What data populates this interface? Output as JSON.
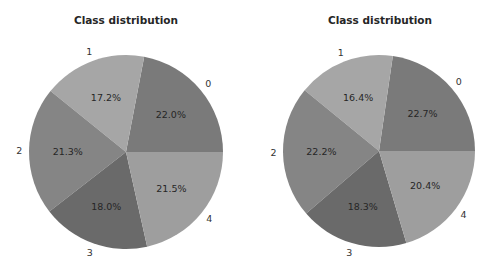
{
  "chart_data": [
    {
      "type": "pie",
      "title": "Class distribution",
      "categories": [
        "0",
        "1",
        "2",
        "3",
        "4"
      ],
      "values": [
        22.0,
        17.2,
        21.3,
        18.0,
        21.5
      ],
      "value_labels": [
        "22.0%",
        "17.2%",
        "21.3%",
        "18.0%",
        "21.5%"
      ],
      "colors": [
        "#7a7a7a",
        "#a6a6a6",
        "#858585",
        "#6a6a6a",
        "#9e9e9e"
      ],
      "start_angle": 0,
      "direction": "counterclockwise",
      "legend": false
    },
    {
      "type": "pie",
      "title": "Class distribution",
      "categories": [
        "0",
        "1",
        "2",
        "3",
        "4"
      ],
      "values": [
        22.7,
        16.4,
        22.2,
        18.3,
        20.4
      ],
      "value_labels": [
        "22.7%",
        "16.4%",
        "22.2%",
        "18.3%",
        "20.4%"
      ],
      "colors": [
        "#7a7a7a",
        "#a6a6a6",
        "#858585",
        "#6a6a6a",
        "#9e9e9e"
      ],
      "start_angle": 0,
      "direction": "counterclockwise",
      "legend": false
    }
  ]
}
